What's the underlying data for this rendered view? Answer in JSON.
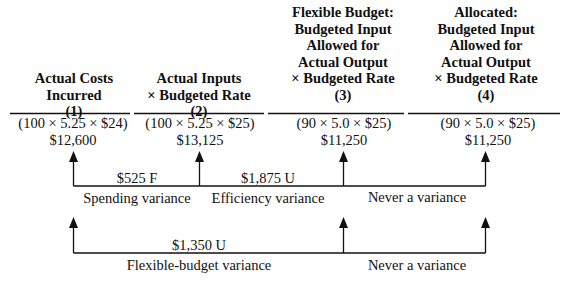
{
  "columns": [
    {
      "heading_lines": [
        "Actual Costs",
        "Incurred"
      ],
      "number": "(1)",
      "formula": "(100 × 5.25 × $24)",
      "amount": "$12,600"
    },
    {
      "heading_lines": [
        "Actual Inputs",
        "× Budgeted Rate"
      ],
      "number": "(2)",
      "formula": "(100 × 5.25 × $25)",
      "amount": "$13,125"
    },
    {
      "heading_lines": [
        "Flexible Budget:",
        "Budgeted Input",
        "Allowed for",
        "Actual Output",
        "× Budgeted Rate"
      ],
      "number": "(3)",
      "formula": "(90 × 5.0 × $25)",
      "amount": "$11,250"
    },
    {
      "heading_lines": [
        "Allocated:",
        "Budgeted Input",
        "Allowed for",
        "Actual Output",
        "× Budgeted Rate"
      ],
      "number": "(4)",
      "formula": "(90 × 5.0 × $25)",
      "amount": "$11,250"
    }
  ],
  "row1": {
    "spending": {
      "amount": "$525 F",
      "label": "Spending variance"
    },
    "efficiency": {
      "amount": "$1,875 U",
      "label": "Efficiency variance"
    },
    "never": {
      "label": "Never a variance"
    }
  },
  "row2": {
    "flexible": {
      "amount": "$1,350 U",
      "label": "Flexible-budget variance"
    },
    "never": {
      "label": "Never a variance"
    }
  }
}
